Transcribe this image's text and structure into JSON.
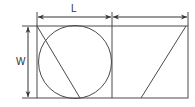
{
  "diagram": {
    "labels": {
      "length": "L",
      "width": "W"
    },
    "colors": {
      "stroke": "#4a4a4a",
      "background": "#ffffff"
    },
    "shapes": {
      "outer_rect": {
        "x": 37,
        "y": 26,
        "w": 151,
        "h": 72
      },
      "divider_x": 112,
      "circle": {
        "cx": 75,
        "cy": 62,
        "r": 37
      },
      "left_diagonal": [
        [
          37,
          26
        ],
        [
          80,
          98
        ]
      ],
      "right_diagonal": [
        [
          186,
          26
        ],
        [
          141,
          98
        ]
      ]
    },
    "dimensions": [
      {
        "label": "L",
        "from": 37,
        "to": 112,
        "y": 17
      },
      {
        "label": "",
        "from": 112,
        "to": 188,
        "y": 17
      },
      {
        "label": "W",
        "from": 26,
        "to": 98,
        "x": 28
      }
    ]
  }
}
